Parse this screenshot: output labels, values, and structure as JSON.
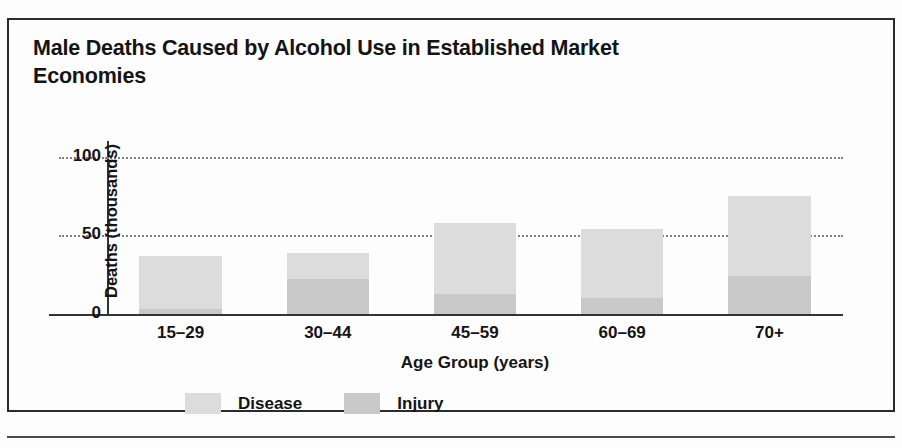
{
  "figure": {
    "title": "Male Deaths Caused by Alcohol Use in Established Market Economies"
  },
  "chart_data": {
    "type": "bar",
    "subtype": "stacked",
    "title": "Male Deaths Caused by Alcohol Use in Established Market Economies",
    "xlabel": "Age Group (years)",
    "ylabel": "Deaths (thousands)",
    "categories": [
      "15–29",
      "30–44",
      "45–59",
      "60–69",
      "70+"
    ],
    "series": [
      {
        "name": "Injury",
        "color": "#c9c9c9",
        "values": [
          3,
          22,
          13,
          10,
          24
        ]
      },
      {
        "name": "Disease",
        "color": "#dcdcdc",
        "values": [
          34,
          17,
          45,
          44,
          51
        ]
      }
    ],
    "totals": [
      37,
      39,
      58,
      54,
      75
    ],
    "ylim": [
      0,
      110
    ],
    "yticks": [
      0,
      50,
      100
    ],
    "ytick_labels": [
      "0",
      "50",
      "100"
    ],
    "grid": "horizontal-dotted",
    "gridline_values": [
      50,
      100
    ],
    "legend_position": "bottom",
    "legend": [
      {
        "label": "Disease",
        "color": "#dcdcdc"
      },
      {
        "label": "Injury",
        "color": "#c9c9c9"
      }
    ]
  }
}
